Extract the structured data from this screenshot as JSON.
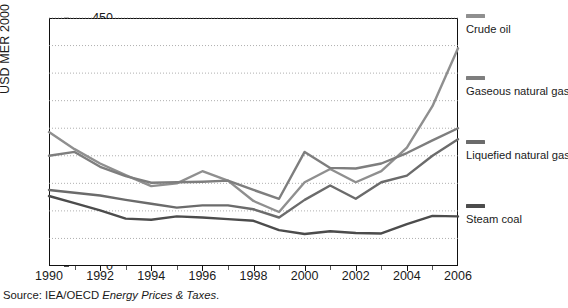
{
  "chart_data": {
    "type": "line",
    "title": "",
    "xlabel": "",
    "ylabel": "USD MER 2000 per toe",
    "xlim": [
      1990,
      2006
    ],
    "ylim": [
      0,
      450
    ],
    "ytick_step": 50,
    "grid": "horizontal-dotted",
    "legend_position": "right",
    "x": [
      1990,
      1991,
      1992,
      1993,
      1994,
      1995,
      1996,
      1997,
      1998,
      1999,
      2000,
      2001,
      2002,
      2003,
      2004,
      2005,
      2006
    ],
    "xticks": [
      1990,
      1992,
      1994,
      1996,
      1998,
      2000,
      2002,
      2004,
      2006
    ],
    "xticks_minor": [
      1991,
      1993,
      1995,
      1997,
      1999,
      2001,
      2003,
      2005
    ],
    "yticks": [
      0,
      50,
      100,
      150,
      200,
      250,
      300,
      350,
      400,
      450
    ],
    "series": [
      {
        "name": "Crude oil",
        "color": "#8f8f8f",
        "values": [
          243,
          212,
          186,
          165,
          145,
          150,
          172,
          155,
          118,
          98,
          152,
          176,
          152,
          172,
          215,
          290,
          395
        ]
      },
      {
        "name": "Gaseous natural gas",
        "color": "#7e7e7e",
        "values": [
          200,
          207,
          180,
          163,
          151,
          152,
          153,
          155,
          138,
          122,
          207,
          178,
          177,
          186,
          205,
          228,
          250
        ]
      },
      {
        "name": "Liquefied natural gas",
        "color": "#6b6b6b",
        "values": [
          138,
          133,
          128,
          120,
          113,
          106,
          110,
          110,
          103,
          88,
          120,
          146,
          122,
          152,
          164,
          200,
          230
        ]
      },
      {
        "name": "Steam coal",
        "color": "#4c4c4c",
        "values": [
          127,
          114,
          101,
          86,
          84,
          90,
          88,
          85,
          82,
          65,
          58,
          63,
          60,
          59,
          76,
          91,
          90
        ]
      }
    ]
  },
  "source": {
    "prefix": "Source: IEA/OECD ",
    "italic": "Energy Prices & Taxes",
    "suffix": "."
  }
}
